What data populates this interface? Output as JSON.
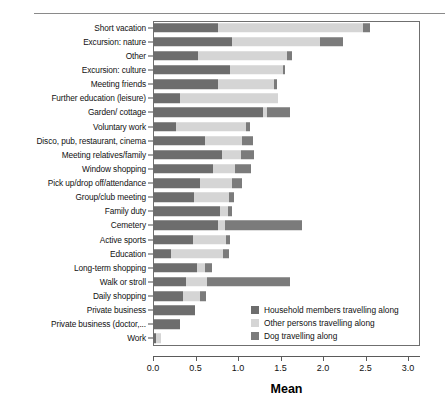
{
  "chart_data": {
    "type": "bar",
    "orientation": "horizontal",
    "stacked": true,
    "title": "",
    "xlabel": "Mean",
    "ylabel": "",
    "xlim": [
      0.0,
      3.14
    ],
    "xticks": [
      0.0,
      0.5,
      1.0,
      1.5,
      2.0,
      2.5,
      3.0
    ],
    "xtick_labels": [
      "0.0",
      "0.5",
      "1.0",
      "1.5",
      "2.0",
      "2.5",
      "3.0"
    ],
    "grid": false,
    "legend_position": "inside lower right",
    "categories": [
      "Short vacation",
      "Excursion: nature",
      "Other",
      "Excursion: culture",
      "Meeting friends",
      "Further education (leisure)",
      "Garden/ cottage",
      "Voluntary work",
      "Disco, pub, restaurant, cinema",
      "Meeting relatives/family",
      "Window shopping",
      "Pick up/drop off/attendance",
      "Group/club meeting",
      "Family duty",
      "Cemetery",
      "Active sports",
      "Education",
      "Long-term shopping",
      "Walk or stroll",
      "Daily shopping",
      "Private business",
      "Private business (doctor,...",
      "Work"
    ],
    "series": [
      {
        "name": "Household members travelling along",
        "color": "#6d6d6d",
        "values": [
          0.76,
          0.93,
          0.53,
          0.91,
          0.76,
          0.32,
          1.29,
          0.27,
          0.61,
          0.81,
          0.71,
          0.55,
          0.48,
          0.79,
          0.76,
          0.47,
          0.21,
          0.52,
          0.39,
          0.35,
          0.49,
          0.32,
          0.03
        ]
      },
      {
        "name": "Other persons travelling along",
        "color": "#d5d5d5",
        "values": [
          1.71,
          1.03,
          1.05,
          0.62,
          0.66,
          1.15,
          0.05,
          0.82,
          0.44,
          0.23,
          0.26,
          0.38,
          0.42,
          0.09,
          0.09,
          0.39,
          0.61,
          0.09,
          0.24,
          0.2,
          0.0,
          0.0,
          0.07
        ]
      },
      {
        "name": "Dog travelling along",
        "color": "#7b7b7b",
        "values": [
          0.08,
          0.27,
          0.06,
          0.02,
          0.04,
          0.0,
          0.27,
          0.05,
          0.13,
          0.15,
          0.18,
          0.12,
          0.05,
          0.05,
          0.9,
          0.05,
          0.07,
          0.08,
          0.98,
          0.07,
          0.0,
          0.0,
          0.0
        ]
      }
    ],
    "totals": [
      2.55,
      2.23,
      1.64,
      1.55,
      1.46,
      1.47,
      1.61,
      1.14,
      1.18,
      1.19,
      1.15,
      1.05,
      0.95,
      0.93,
      1.75,
      0.91,
      0.89,
      0.69,
      1.61,
      0.62,
      0.49,
      0.32,
      0.1
    ]
  },
  "legend": {
    "items": [
      {
        "label": "Household members travelling along",
        "color": "#6d6d6d"
      },
      {
        "label": "Other persons travelling along",
        "color": "#d5d5d5"
      },
      {
        "label": "Dog travelling along",
        "color": "#7b7b7b"
      }
    ]
  },
  "axis": {
    "x_title": "Mean"
  }
}
